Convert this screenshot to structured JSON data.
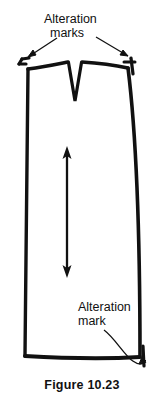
{
  "figure": {
    "caption": "Figure 10.23",
    "background_color": "#ffffff",
    "ink_color": "#111111"
  },
  "labels": {
    "top": {
      "line1": "Alteration",
      "line2": "marks",
      "points_to": [
        "left-waist-alteration-mark",
        "right-waist-alteration-mark"
      ]
    },
    "bottom": {
      "line1": "Alteration",
      "line2": "mark",
      "points_to": [
        "hem-right-alteration-mark"
      ]
    }
  },
  "annotations": {
    "grainline_arrow": "double-headed-vertical-arrow",
    "dart": "center-front-dart",
    "leader_left": "straight-arrow-to-left-mark",
    "leader_right": "straight-arrow-to-right-mark",
    "leader_bottom": "curved-arrow-to-hem-mark"
  }
}
